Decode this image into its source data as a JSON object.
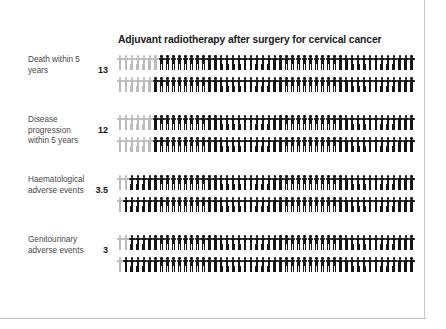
{
  "chart_data": {
    "type": "pictogram",
    "title": "Adjuvant radiotherapy after surgery for cervical cancer",
    "xlabel": "",
    "ylabel": "",
    "units": "people affected per 100",
    "icons_per_row": 100,
    "icons_per_line": 50,
    "lines_per_row": 2,
    "highlight_color": "#bcbcbc",
    "base_color": "#151515",
    "categories": [
      "Death within 5 years",
      "Disease progression within 5 years",
      "Haematological adverse events",
      "Genitourinary adverse events"
    ],
    "values": [
      13,
      12,
      3.5,
      3
    ],
    "value_labels": [
      "13",
      "12",
      "3.5",
      "3"
    ],
    "rows": [
      {
        "label": "Death within 5 years",
        "value": 13,
        "value_label": "13",
        "highlighted": 13,
        "total": 100
      },
      {
        "label": "Disease progression within 5 years",
        "value": 12,
        "value_label": "12",
        "highlighted": 12,
        "total": 100
      },
      {
        "label": "Haematological adverse events",
        "value": 3.5,
        "value_label": "3.5",
        "highlighted": 3.5,
        "total": 100
      },
      {
        "label": "Genitourinary adverse events",
        "value": 3,
        "value_label": "3",
        "highlighted": 3,
        "total": 100
      }
    ]
  },
  "colors": {
    "page_background": "#ffffff",
    "title_text": "#1b1b1b",
    "label_text": "#4a4a4a",
    "value_text": "#151515",
    "icon_highlight": "#bcbcbc",
    "icon_base": "#151515",
    "frame_line": "#c9c9c9"
  }
}
